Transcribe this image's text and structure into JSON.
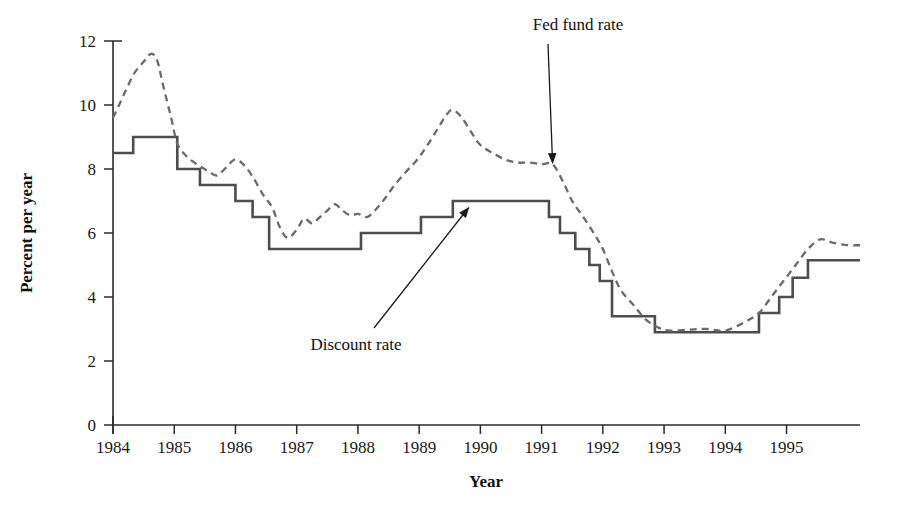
{
  "chart_data": {
    "type": "line",
    "title": "",
    "xlabel": "Year",
    "ylabel": "Percent per year",
    "xlim": [
      1984,
      1996.2
    ],
    "ylim": [
      0,
      12
    ],
    "grid": false,
    "legend_position": "inline-annotations",
    "x_ticks": [
      "1984",
      "1985",
      "1986",
      "1987",
      "1988",
      "1989",
      "1990",
      "1991",
      "1992",
      "1993",
      "1994",
      "1995"
    ],
    "x_tick_values": [
      1984,
      1985,
      1986,
      1987,
      1988,
      1989,
      1990,
      1991,
      1992,
      1993,
      1994,
      1995
    ],
    "y_ticks": [
      "0",
      "2",
      "4",
      "6",
      "8",
      "10",
      "12"
    ],
    "y_tick_values": [
      0,
      2,
      4,
      6,
      8,
      10,
      12
    ],
    "annotations": [
      {
        "name": "fed-fund-rate",
        "text": "Fed fund rate",
        "text_x": 578,
        "text_y": 30,
        "point_x": 1991.18,
        "point_y": 8.15
      },
      {
        "name": "discount-rate",
        "text": "Discount rate",
        "text_x": 356,
        "text_y": 350,
        "point_x": 1989.82,
        "point_y": 6.82
      }
    ],
    "series": [
      {
        "name": "Discount rate",
        "style": "solid",
        "color": "#4d4d4d",
        "step": true,
        "x": [
          1984.0,
          1984.33,
          1984.33,
          1985.05,
          1985.05,
          1985.42,
          1985.42,
          1986.0,
          1986.0,
          1986.28,
          1986.28,
          1986.55,
          1986.55,
          1986.85,
          1986.85,
          1988.05,
          1988.05,
          1989.03,
          1989.03,
          1989.55,
          1989.55,
          1991.12,
          1991.12,
          1991.3,
          1991.3,
          1991.55,
          1991.55,
          1991.78,
          1991.78,
          1991.95,
          1991.95,
          1992.15,
          1992.15,
          1992.85,
          1992.85,
          1994.55,
          1994.55,
          1994.88,
          1994.88,
          1995.1,
          1995.1,
          1995.35,
          1995.35,
          1996.2
        ],
        "y": [
          8.5,
          8.5,
          9.0,
          9.0,
          8.0,
          8.0,
          7.5,
          7.5,
          7.0,
          7.0,
          6.5,
          6.5,
          5.5,
          5.5,
          5.5,
          5.5,
          6.0,
          6.0,
          6.5,
          6.5,
          7.0,
          7.0,
          6.5,
          6.5,
          6.0,
          6.0,
          5.5,
          5.5,
          5.0,
          5.0,
          4.5,
          4.5,
          3.4,
          3.4,
          2.9,
          2.9,
          3.5,
          3.5,
          4.0,
          4.0,
          4.6,
          4.6,
          5.15,
          5.15
        ],
        "values_described": "Fed discount rate, step function from 8.5% in 1984 rising to 9.0%, falling through 1986 to 5.5%, rising to 7.0% by 1989-1991, dropping to 2.9% by 1993, then rising to 5.15% by 1995"
      },
      {
        "name": "Fed fund rate",
        "style": "dashed",
        "color": "#6a6a6a",
        "step": false,
        "x": [
          1984.0,
          1984.1,
          1984.22,
          1984.35,
          1984.5,
          1984.62,
          1984.72,
          1984.82,
          1984.95,
          1985.05,
          1985.2,
          1985.33,
          1985.45,
          1985.58,
          1985.7,
          1985.85,
          1986.0,
          1986.15,
          1986.3,
          1986.45,
          1986.6,
          1986.72,
          1986.85,
          1987.0,
          1987.12,
          1987.25,
          1987.38,
          1987.5,
          1987.62,
          1987.75,
          1987.88,
          1988.0,
          1988.15,
          1988.3,
          1988.45,
          1988.6,
          1988.78,
          1988.95,
          1989.12,
          1989.3,
          1989.45,
          1989.55,
          1989.7,
          1989.85,
          1990.0,
          1990.2,
          1990.4,
          1990.6,
          1990.8,
          1991.0,
          1991.18,
          1991.35,
          1991.5,
          1991.68,
          1991.85,
          1992.0,
          1992.15,
          1992.3,
          1992.5,
          1992.7,
          1992.9,
          1993.1,
          1993.4,
          1993.7,
          1994.0,
          1994.3,
          1994.55,
          1994.75,
          1994.95,
          1995.15,
          1995.35,
          1995.55,
          1995.75,
          1996.0,
          1996.2
        ],
        "y": [
          9.6,
          10.0,
          10.5,
          11.0,
          11.35,
          11.6,
          11.4,
          10.6,
          9.6,
          8.8,
          8.4,
          8.2,
          8.05,
          7.9,
          7.8,
          8.05,
          8.3,
          8.1,
          7.7,
          7.2,
          6.8,
          6.2,
          5.85,
          6.1,
          6.45,
          6.3,
          6.5,
          6.7,
          6.9,
          6.7,
          6.55,
          6.6,
          6.5,
          6.75,
          7.1,
          7.5,
          7.9,
          8.25,
          8.7,
          9.25,
          9.7,
          9.85,
          9.6,
          9.15,
          8.75,
          8.5,
          8.3,
          8.2,
          8.2,
          8.15,
          8.15,
          7.6,
          7.0,
          6.5,
          6.0,
          5.5,
          4.8,
          4.2,
          3.75,
          3.3,
          3.05,
          2.95,
          2.98,
          3.0,
          2.95,
          3.2,
          3.5,
          4.0,
          4.5,
          5.0,
          5.5,
          5.8,
          5.7,
          5.62,
          5.62
        ],
        "values_described": "Federal funds rate, smooth volatile line peaking at 11.6% mid-1984, trough 5.85% late 1986, second peak 9.85% mid-1989, falling to 2.95% by 1993, rising to ~5.8% in 1995"
      }
    ]
  }
}
